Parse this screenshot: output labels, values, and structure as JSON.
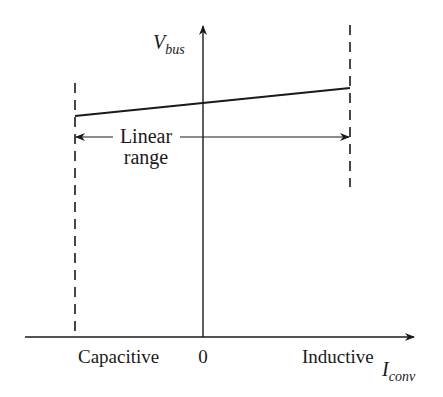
{
  "diagram": {
    "y_axis": {
      "label_main": "V",
      "label_sub": "bus"
    },
    "x_axis": {
      "label_main": "I",
      "label_sub": "conv",
      "origin_label": "0"
    },
    "region_labels": {
      "left": "Capacitive",
      "right": "Inductive"
    },
    "annotation": {
      "line1": "Linear",
      "line2": "range"
    },
    "colors": {
      "ink": "#1a1a1a",
      "background": "#ffffff"
    }
  }
}
